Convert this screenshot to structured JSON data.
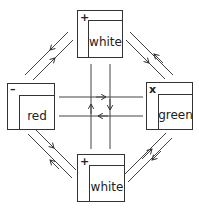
{
  "diagram": {
    "nodes": [
      {
        "id": "top",
        "label": "white",
        "symbol": "+",
        "x": 77,
        "y": 10,
        "w": 46,
        "h": 48
      },
      {
        "id": "left",
        "label": "red",
        "symbol": "–",
        "x": 7,
        "y": 83,
        "w": 48,
        "h": 47
      },
      {
        "id": "right",
        "label": "green",
        "symbol": "x",
        "x": 146,
        "y": 82,
        "w": 47,
        "h": 48
      },
      {
        "id": "bottom",
        "label": "white",
        "symbol": "+",
        "x": 77,
        "y": 154,
        "w": 48,
        "h": 48
      }
    ],
    "edges": [
      {
        "from": "top",
        "to": "left",
        "direction": "down-left"
      },
      {
        "from": "left",
        "to": "top",
        "direction": "up-right"
      },
      {
        "from": "top",
        "to": "right",
        "direction": "down-right"
      },
      {
        "from": "right",
        "to": "top",
        "direction": "up-left"
      },
      {
        "from": "left",
        "to": "bottom",
        "direction": "down-right"
      },
      {
        "from": "bottom",
        "to": "left",
        "direction": "up-left"
      },
      {
        "from": "bottom",
        "to": "right",
        "direction": "up-right"
      },
      {
        "from": "right",
        "to": "bottom",
        "direction": "down-left"
      },
      {
        "from": "left",
        "to": "right",
        "direction": "right"
      },
      {
        "from": "right",
        "to": "left",
        "direction": "left"
      },
      {
        "from": "bottom",
        "to": "top",
        "direction": "up"
      },
      {
        "from": "top",
        "to": "bottom",
        "direction": "down"
      }
    ]
  }
}
